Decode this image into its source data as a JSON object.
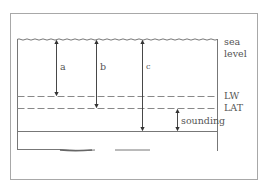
{
  "diagram": {
    "type": "tide-depth-reference",
    "labels": {
      "sea_level_line1": "sea",
      "sea_level_line2": "level",
      "lw": "LW",
      "lat": "LAT",
      "sounding": "sounding",
      "a": "a",
      "b": "b",
      "c": "c"
    },
    "colors": {
      "line": "#555555",
      "frame": "#9a9a9a",
      "text": "#555555"
    }
  }
}
